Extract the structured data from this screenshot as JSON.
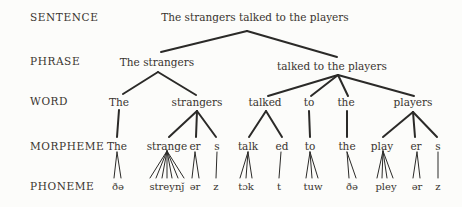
{
  "figure": {
    "background": "#fcfcfa",
    "text_color": "#39342f",
    "line_color": "#2b2a28"
  },
  "rows": [
    {
      "label": "SENTENCE",
      "x": 30,
      "y": 17
    },
    {
      "label": "PHRASE",
      "x": 30,
      "y": 61
    },
    {
      "label": "WORD",
      "x": 30,
      "y": 101
    },
    {
      "label": "MORPHEME",
      "x": 30,
      "y": 146
    },
    {
      "label": "PHONEME",
      "x": 30,
      "y": 186
    }
  ],
  "tree": {
    "nodes": [
      {
        "name": "node-sentence",
        "text": "The strangers talked to the players",
        "x": 255,
        "y": 17,
        "cls": ""
      },
      {
        "name": "node-phrase-the-strangers",
        "text": "The strangers",
        "x": 157,
        "y": 62,
        "cls": ""
      },
      {
        "name": "node-phrase-talked-to-the-players",
        "text": "talked to the players",
        "x": 332,
        "y": 66,
        "cls": ""
      },
      {
        "name": "node-word-the-1",
        "text": "The",
        "x": 119,
        "y": 102,
        "cls": ""
      },
      {
        "name": "node-word-strangers",
        "text": "strangers",
        "x": 197,
        "y": 102,
        "cls": ""
      },
      {
        "name": "node-word-talked",
        "text": "talked",
        "x": 265,
        "y": 102,
        "cls": ""
      },
      {
        "name": "node-word-to",
        "text": "to",
        "x": 309,
        "y": 102,
        "cls": ""
      },
      {
        "name": "node-word-the-2",
        "text": "the",
        "x": 346,
        "y": 102,
        "cls": ""
      },
      {
        "name": "node-word-players",
        "text": "players",
        "x": 413,
        "y": 102,
        "cls": ""
      },
      {
        "name": "node-morpheme-the-1",
        "text": "The",
        "x": 117,
        "y": 146,
        "cls": ""
      },
      {
        "name": "node-morpheme-strange",
        "text": "strange",
        "x": 167,
        "y": 146,
        "cls": ""
      },
      {
        "name": "node-morpheme-er-1",
        "text": "er",
        "x": 195,
        "y": 146,
        "cls": ""
      },
      {
        "name": "node-morpheme-s-1",
        "text": "s",
        "x": 217,
        "y": 146,
        "cls": ""
      },
      {
        "name": "node-morpheme-talk",
        "text": "talk",
        "x": 248,
        "y": 146,
        "cls": ""
      },
      {
        "name": "node-morpheme-ed",
        "text": "ed",
        "x": 282,
        "y": 146,
        "cls": ""
      },
      {
        "name": "node-morpheme-to",
        "text": "to",
        "x": 310,
        "y": 146,
        "cls": ""
      },
      {
        "name": "node-morpheme-the-2",
        "text": "the",
        "x": 347,
        "y": 146,
        "cls": ""
      },
      {
        "name": "node-morpheme-play",
        "text": "play",
        "x": 382,
        "y": 146,
        "cls": ""
      },
      {
        "name": "node-morpheme-er-2",
        "text": "er",
        "x": 416,
        "y": 146,
        "cls": ""
      },
      {
        "name": "node-morpheme-s-2",
        "text": "s",
        "x": 438,
        "y": 146,
        "cls": ""
      },
      {
        "name": "node-phoneme-dhe-1",
        "text": "ðə",
        "x": 118,
        "y": 186,
        "cls": "phoneme"
      },
      {
        "name": "node-phoneme-streynj",
        "text": "streynǰ",
        "x": 167,
        "y": 186,
        "cls": "phoneme"
      },
      {
        "name": "node-phoneme-er-1",
        "text": "ər",
        "x": 195,
        "y": 186,
        "cls": "phoneme"
      },
      {
        "name": "node-phoneme-z-1",
        "text": "z",
        "x": 216,
        "y": 186,
        "cls": "phoneme"
      },
      {
        "name": "node-phoneme-tok",
        "text": "tɔk",
        "x": 246,
        "y": 186,
        "cls": "phoneme"
      },
      {
        "name": "node-phoneme-t",
        "text": "t",
        "x": 279,
        "y": 186,
        "cls": "phoneme"
      },
      {
        "name": "node-phoneme-tuw",
        "text": "tuw",
        "x": 313,
        "y": 186,
        "cls": "phoneme"
      },
      {
        "name": "node-phoneme-dhe-2",
        "text": "ðə",
        "x": 352,
        "y": 186,
        "cls": "phoneme"
      },
      {
        "name": "node-phoneme-pley",
        "text": "pley",
        "x": 386,
        "y": 186,
        "cls": "phoneme"
      },
      {
        "name": "node-phoneme-er-2",
        "text": "ər",
        "x": 417,
        "y": 186,
        "cls": "phoneme"
      },
      {
        "name": "node-phoneme-z-2",
        "text": "z",
        "x": 438,
        "y": 186,
        "cls": "phoneme"
      }
    ],
    "edges": [
      [
        247,
        31,
        161,
        52,
        2
      ],
      [
        247,
        31,
        337,
        57,
        2
      ],
      [
        158,
        72,
        123,
        94,
        2
      ],
      [
        158,
        72,
        196,
        95,
        2
      ],
      [
        338,
        75,
        268,
        96,
        2
      ],
      [
        338,
        75,
        311,
        96,
        2
      ],
      [
        338,
        75,
        348,
        96,
        2
      ],
      [
        338,
        75,
        414,
        96,
        2
      ],
      [
        119,
        110,
        117,
        137,
        2
      ],
      [
        197,
        111,
        169,
        137,
        2
      ],
      [
        197,
        111,
        196,
        137,
        2
      ],
      [
        197,
        111,
        216,
        137,
        2
      ],
      [
        266,
        111,
        249,
        137,
        2
      ],
      [
        266,
        111,
        282,
        137,
        2
      ],
      [
        309,
        111,
        310,
        137,
        2
      ],
      [
        347,
        111,
        347,
        137,
        2
      ],
      [
        413,
        112,
        383,
        137,
        2
      ],
      [
        413,
        112,
        415,
        137,
        2
      ],
      [
        413,
        112,
        437,
        137,
        2
      ],
      [
        117,
        152,
        114,
        178,
        1
      ],
      [
        117,
        152,
        121,
        178,
        1
      ],
      [
        167,
        151,
        150,
        178,
        1
      ],
      [
        167,
        151,
        156,
        178,
        1
      ],
      [
        167,
        151,
        162,
        178,
        1
      ],
      [
        167,
        151,
        167,
        178,
        1
      ],
      [
        167,
        151,
        172,
        178,
        1
      ],
      [
        167,
        151,
        178,
        178,
        1
      ],
      [
        167,
        151,
        184,
        178,
        1
      ],
      [
        195,
        152,
        192,
        178,
        1
      ],
      [
        195,
        152,
        199,
        178,
        1
      ],
      [
        217,
        152,
        216,
        178,
        1
      ],
      [
        248,
        152,
        240,
        178,
        1
      ],
      [
        248,
        152,
        246,
        178,
        1
      ],
      [
        248,
        152,
        252,
        178,
        1
      ],
      [
        281,
        152,
        279,
        178,
        1
      ],
      [
        310,
        152,
        306,
        178,
        1
      ],
      [
        310,
        152,
        312,
        178,
        1
      ],
      [
        310,
        152,
        318,
        178,
        1
      ],
      [
        347,
        152,
        349,
        178,
        1
      ],
      [
        347,
        152,
        356,
        178,
        1
      ],
      [
        383,
        151,
        377,
        178,
        1
      ],
      [
        383,
        151,
        382,
        178,
        1
      ],
      [
        383,
        151,
        387,
        178,
        1
      ],
      [
        383,
        151,
        393,
        178,
        1
      ],
      [
        417,
        152,
        413,
        178,
        1
      ],
      [
        417,
        152,
        420,
        178,
        1
      ],
      [
        438,
        152,
        438,
        178,
        1
      ]
    ]
  }
}
